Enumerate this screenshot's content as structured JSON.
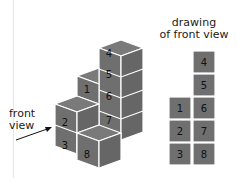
{
  "labels": {
    "front_view": [
      "front",
      "view"
    ],
    "drawing_title": [
      "drawing",
      "of front view"
    ]
  },
  "colors": {
    "cube_front": "#6f6f6f",
    "cube_top": "#777777",
    "cube_side": "#666666",
    "edge": "#ffffff",
    "text": "#111111"
  },
  "iso_cubes": [
    {
      "n": "4"
    },
    {
      "n": "5"
    },
    {
      "n": "6"
    },
    {
      "n": "7"
    },
    {
      "n": "1"
    },
    {
      "n": "2"
    },
    {
      "n": "3"
    },
    {
      "n": "8"
    }
  ],
  "front_view_grid": [
    {
      "n": "4",
      "col": 1,
      "row": 0
    },
    {
      "n": "5",
      "col": 1,
      "row": 1
    },
    {
      "n": "1",
      "col": 0,
      "row": 2
    },
    {
      "n": "6",
      "col": 1,
      "row": 2
    },
    {
      "n": "2",
      "col": 0,
      "row": 3
    },
    {
      "n": "7",
      "col": 1,
      "row": 3
    },
    {
      "n": "3",
      "col": 0,
      "row": 4
    },
    {
      "n": "8",
      "col": 1,
      "row": 4
    }
  ]
}
